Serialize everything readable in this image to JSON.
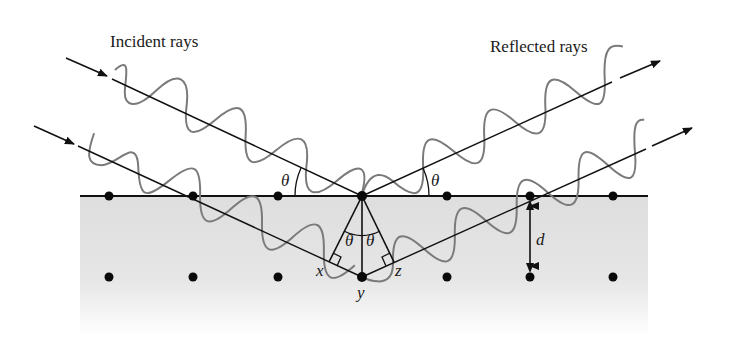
{
  "diagram": {
    "title_left": "Incident rays",
    "title_right": "Reflected rays",
    "labels": {
      "theta_left": "θ",
      "theta_right": "θ",
      "theta_inner_left": "θ",
      "theta_inner_right": "θ",
      "x": "x",
      "y": "y",
      "z": "z",
      "d": "d"
    },
    "colors": {
      "line": "#111111",
      "wave": "#7a7a7a",
      "crystal_fill": "#e4e4e4",
      "dot": "#0a0a0a"
    },
    "atoms": {
      "row1_y": 196,
      "row2_y": 277,
      "x_positions": [
        109,
        193,
        278,
        362,
        447,
        530,
        613
      ]
    }
  }
}
